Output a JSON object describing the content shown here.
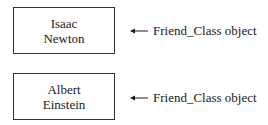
{
  "objects": [
    {
      "line1": "Isaac",
      "line2": "Newton",
      "label": "Friend_Class object"
    },
    {
      "line1": "Albert",
      "line2": "Einstein",
      "label": "Friend_Class object"
    }
  ]
}
